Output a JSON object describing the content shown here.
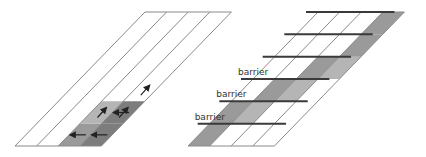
{
  "diagram": {
    "colors": {
      "strip_outline": "#8a8a8a",
      "shade_light": "#b5b5b5",
      "shade_mid": "#9a9a9a",
      "shade_dark": "#7d7d7d",
      "arrow": "#222222",
      "barrier": "#3a3a3a",
      "label": "#333333"
    },
    "left_panel": {
      "strip_count": 4,
      "shaded_cells": [
        {
          "strip": 2,
          "rows": [
            0
          ],
          "tone": "mid"
        },
        {
          "strip": 3,
          "rows": [
            0,
            1
          ],
          "tone": "dark"
        },
        {
          "strip": 2,
          "rows": [
            1
          ],
          "tone": "light"
        }
      ],
      "arrows": [
        {
          "direction": "left",
          "strip": 2,
          "row": 0
        },
        {
          "direction": "left",
          "strip": 3,
          "row": 0
        },
        {
          "direction": "up",
          "strip": 2,
          "row": 1
        },
        {
          "direction": "left",
          "strip": 3,
          "row": 1
        },
        {
          "direction": "up",
          "strip": 3,
          "row": 1
        },
        {
          "direction": "up",
          "strip": 3,
          "row": 2
        }
      ]
    },
    "right_panel": {
      "strip_count": 4,
      "barrier_label": "barrier",
      "barriers": [
        {
          "label": "barrier",
          "row": 1
        },
        {
          "label": "barrier",
          "row": 2
        },
        {
          "label": "barrier",
          "row": 3
        },
        {
          "label": "",
          "row": 4
        },
        {
          "label": "",
          "row": 5
        },
        {
          "label": "",
          "row": 6
        }
      ],
      "shaded_cells": [
        {
          "strip": 0,
          "row": 0,
          "tone": "mid"
        },
        {
          "strip": 0,
          "row": 1,
          "tone": "mid"
        },
        {
          "strip": 1,
          "row": 1,
          "tone": "light"
        },
        {
          "strip": 1,
          "row": 2,
          "tone": "mid"
        },
        {
          "strip": 2,
          "row": 2,
          "tone": "light"
        },
        {
          "strip": 2,
          "row": 3,
          "tone": "mid"
        },
        {
          "strip": 3,
          "row": 3,
          "tone": "light"
        },
        {
          "strip": 3,
          "row": 4,
          "tone": "mid"
        },
        {
          "strip": 3,
          "row": 5,
          "tone": "mid"
        }
      ]
    }
  }
}
